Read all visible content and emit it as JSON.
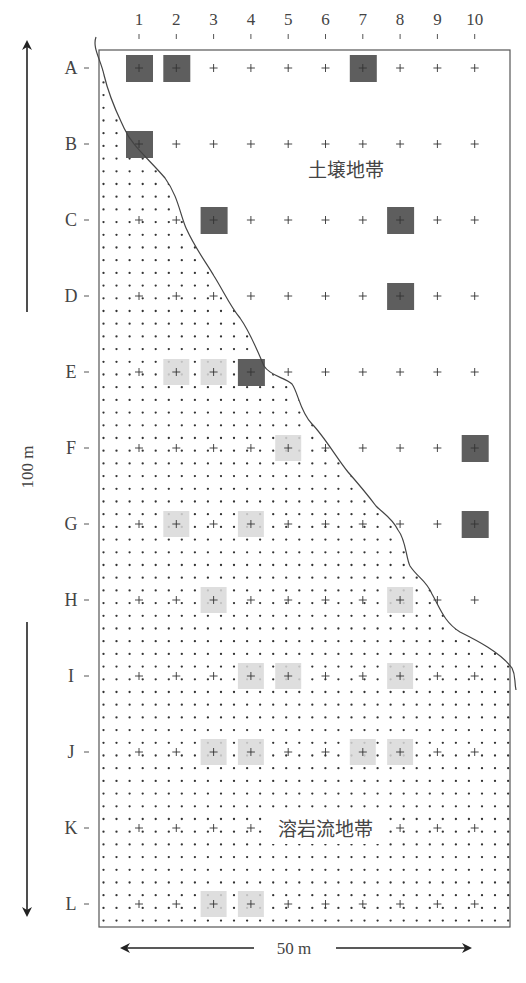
{
  "figure": {
    "columns": [
      "1",
      "2",
      "3",
      "4",
      "5",
      "6",
      "7",
      "8",
      "9",
      "10"
    ],
    "rows": [
      "A",
      "B",
      "C",
      "D",
      "E",
      "F",
      "G",
      "H",
      "I",
      "J",
      "K",
      "L"
    ],
    "zones": {
      "soil": {
        "label": "土壌地帯"
      },
      "lava": {
        "label": "溶岩流地帯"
      }
    },
    "scale": {
      "vertical": "100 m",
      "horizontal": "50 m"
    },
    "colors": {
      "dark_square": "#5e5e5e",
      "light_square": "#d8d8d8",
      "line": "#444444",
      "dot": "#333333"
    },
    "dark_squares": [
      "A1",
      "A2",
      "A7",
      "B1",
      "C3",
      "C8",
      "D8",
      "E4",
      "F10",
      "G10"
    ],
    "light_squares": [
      "E2",
      "E3",
      "F5",
      "G2",
      "G4",
      "H3",
      "H8",
      "I4",
      "I5",
      "I8",
      "J3",
      "J4",
      "J7",
      "J8",
      "L3",
      "L4"
    ]
  }
}
